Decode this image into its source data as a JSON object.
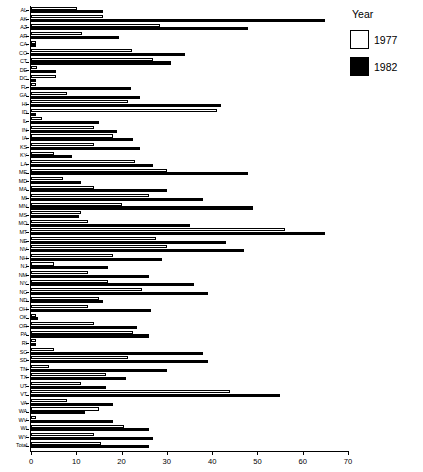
{
  "chart_data": {
    "type": "bar",
    "orientation": "horizontal",
    "title": "",
    "xlabel": "",
    "ylabel": "",
    "xlim": [
      0,
      70
    ],
    "xticks": [
      0,
      10,
      20,
      30,
      40,
      50,
      60,
      70
    ],
    "grid": false,
    "legend": {
      "title": "Year",
      "position": "right",
      "entries": [
        {
          "name": "1977",
          "color": "#ffffff",
          "swatch": "white-square"
        },
        {
          "name": "1982",
          "color": "#000000",
          "swatch": "black-square"
        }
      ]
    },
    "categories": [
      "AL",
      "AK",
      "AZ",
      "AR",
      "CA",
      "CO",
      "CT",
      "DE",
      "DC",
      "FL",
      "GA",
      "HI",
      "ID",
      "IL",
      "IN",
      "IA",
      "KS",
      "KY",
      "LA",
      "ME",
      "MD",
      "MA",
      "MI",
      "MN",
      "MS",
      "MO",
      "MT",
      "NE",
      "NV",
      "NH",
      "NJ",
      "NM",
      "NY",
      "NC",
      "ND",
      "OH",
      "OK",
      "OR",
      "PA",
      "RI",
      "SC",
      "SD",
      "TN",
      "TX",
      "UT",
      "VT",
      "VA",
      "WA",
      "WV",
      "WI",
      "WY",
      "Total"
    ],
    "series": [
      {
        "name": "1977",
        "color": "#ffffff",
        "values": [
          10.2,
          16.0,
          28.5,
          11.3,
          1.0,
          22.2,
          27.0,
          1.3,
          5.5,
          1.2,
          8.0,
          21.5,
          41.0,
          2.5,
          14.0,
          18.0,
          14.0,
          5.0,
          23.0,
          30.0,
          7.0,
          14.0,
          26.0,
          20.0,
          11.0,
          12.5,
          56.0,
          27.5,
          30.0,
          18.0,
          5.0,
          12.5,
          17.0,
          24.5,
          15.0,
          12.5,
          1.2,
          14.0,
          22.5,
          1.0,
          5.0,
          21.5,
          4.0,
          16.5,
          11.0,
          44.0,
          8.0,
          15.0,
          1.0,
          20.5,
          14.0,
          15.5
        ]
      },
      {
        "name": "1982",
        "color": "#000000",
        "values": [
          16.0,
          65.0,
          48.0,
          19.5,
          1.0,
          34.0,
          31.0,
          5.5,
          1.0,
          22.0,
          24.0,
          42.0,
          1.0,
          15.0,
          19.0,
          22.5,
          24.0,
          9.0,
          27.0,
          48.0,
          11.0,
          30.0,
          38.0,
          49.0,
          10.5,
          35.0,
          65.0,
          43.0,
          47.0,
          29.0,
          17.0,
          26.0,
          36.0,
          39.0,
          16.0,
          26.5,
          1.5,
          23.5,
          26.0,
          1.0,
          38.0,
          39.0,
          30.0,
          21.0,
          16.5,
          55.0,
          18.0,
          12.0,
          18.0,
          26.0,
          27.0,
          26.0
        ]
      }
    ]
  }
}
